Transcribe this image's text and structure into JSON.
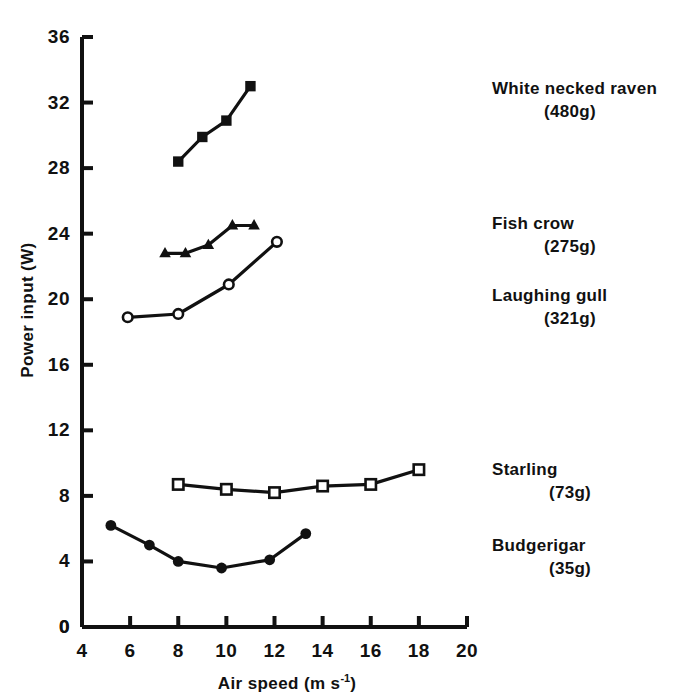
{
  "chart_data": {
    "type": "line",
    "title": "",
    "xlabel": "Air speed (m s",
    "xlabel_sup": "-1",
    "xlabel_tail": ")",
    "ylabel": "Power input (W)",
    "xlim": [
      4,
      20
    ],
    "ylim": [
      0,
      36
    ],
    "xticks": [
      4,
      6,
      8,
      10,
      12,
      14,
      16,
      18,
      20
    ],
    "yticks": [
      0,
      4,
      8,
      12,
      16,
      20,
      24,
      28,
      32,
      36
    ],
    "grid": false,
    "legend_position": "right",
    "origin_label": "0",
    "series": [
      {
        "name": "White necked raven",
        "mass": "(480g)",
        "marker": "filled-square",
        "x": [
          8.0,
          9.0,
          10.0,
          11.0
        ],
        "y": [
          28.4,
          29.9,
          30.9,
          33.0
        ]
      },
      {
        "name": "Fish crow",
        "mass": "(275g)",
        "marker": "filled-triangle",
        "x": [
          7.45,
          8.3,
          9.25,
          10.25,
          11.15
        ],
        "y": [
          22.8,
          22.8,
          23.3,
          24.5,
          24.5
        ]
      },
      {
        "name": "Laughing gull",
        "mass": "(321g)",
        "marker": "open-circle",
        "x": [
          5.9,
          8.0,
          10.1,
          12.1
        ],
        "y": [
          18.9,
          19.1,
          20.9,
          23.5
        ]
      },
      {
        "name": "Starling",
        "mass": "(73g)",
        "marker": "open-square",
        "x": [
          8.0,
          10.0,
          12.0,
          14.0,
          16.0,
          18.0
        ],
        "y": [
          8.7,
          8.4,
          8.2,
          8.6,
          8.7,
          9.6
        ]
      },
      {
        "name": "Budgerigar",
        "mass": "(35g)",
        "marker": "filled-circle",
        "x": [
          5.2,
          6.8,
          8.0,
          9.8,
          11.8,
          13.3
        ],
        "y": [
          6.2,
          5.0,
          4.0,
          3.6,
          4.1,
          5.7
        ]
      }
    ]
  },
  "legend": [
    {
      "name": "White necked raven",
      "mass": "(480g)",
      "top": 78
    },
    {
      "name": "Fish crow",
      "mass": "(275g)",
      "top": 213
    },
    {
      "name": "Laughing gull",
      "mass": "(321g)",
      "top": 285
    },
    {
      "name": "Starling",
      "mass": "(73g)",
      "top": 459
    },
    {
      "name": "Budgerigar",
      "mass": "(35g)",
      "top": 535
    }
  ],
  "axes": {
    "y_title": "Power input (W)",
    "x_title_main": "Air speed (m s",
    "x_title_sup": "-1",
    "x_title_end": ")",
    "origin": "0"
  },
  "scan_header": ""
}
